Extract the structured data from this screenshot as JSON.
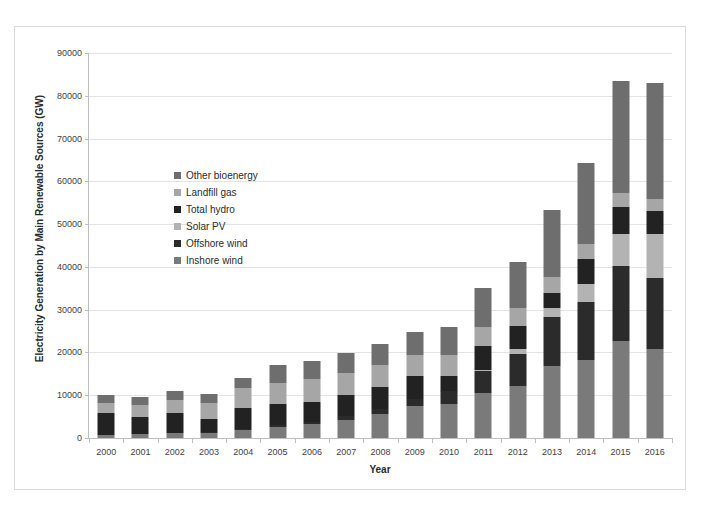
{
  "chart_data": {
    "type": "bar",
    "stacked": true,
    "title": "",
    "xlabel": "Year",
    "ylabel": "Electricity Generation by Main Renewable Sources (GW)",
    "ylim": [
      0,
      90000
    ],
    "ytick_step": 10000,
    "yticks": [
      "0",
      "10000",
      "20000",
      "30000",
      "40000",
      "50000",
      "60000",
      "70000",
      "80000",
      "90000"
    ],
    "grid": true,
    "legend_position": "inside-upper-left",
    "categories": [
      "2000",
      "2001",
      "2002",
      "2003",
      "2004",
      "2005",
      "2006",
      "2007",
      "2008",
      "2009",
      "2010",
      "2011",
      "2012",
      "2013",
      "2014",
      "2015",
      "2016"
    ],
    "series": [
      {
        "name": "Inshore wind",
        "color": "#7a7a7a",
        "values": [
          800,
          900,
          1100,
          1200,
          1900,
          2600,
          3200,
          4300,
          5600,
          7500,
          8000,
          10500,
          12100,
          16800,
          18300,
          22700,
          20900
        ]
      },
      {
        "name": "Offshore wind",
        "color": "#2b2b2b",
        "values": [
          0,
          0,
          0,
          100,
          300,
          400,
          650,
          800,
          1300,
          1700,
          2900,
          5100,
          7500,
          11500,
          13600,
          17600,
          16400
        ]
      },
      {
        "name": "Solar PV",
        "color": "#b3b3b3",
        "values": [
          0,
          0,
          0,
          0,
          0,
          0,
          0,
          0,
          0,
          0,
          100,
          250,
          1300,
          2000,
          4100,
          7500,
          10300
        ]
      },
      {
        "name": "Total hydro",
        "color": "#222222",
        "values": [
          5100,
          4100,
          4800,
          3100,
          4800,
          4900,
          4600,
          5000,
          5100,
          5300,
          3600,
          5700,
          5300,
          3500,
          5900,
          6300,
          5400
        ]
      },
      {
        "name": "Landfill gas",
        "color": "#a6a6a6",
        "values": [
          2400,
          2700,
          3100,
          3800,
          4600,
          5000,
          5300,
          5200,
          5100,
          4900,
          4700,
          4400,
          4100,
          3800,
          3500,
          3200,
          3000
        ]
      },
      {
        "name": "Other bioenergy",
        "color": "#6e6e6e",
        "values": [
          1700,
          1800,
          2000,
          2200,
          2400,
          4100,
          4250,
          4500,
          4800,
          5400,
          6700,
          9200,
          10800,
          15600,
          19000,
          26200,
          27000
        ]
      }
    ],
    "totals": [
      10000,
      9500,
      11000,
      10400,
      14000,
      17000,
      18000,
      19800,
      21900,
      24800,
      26000,
      35150,
      41100,
      53200,
      64400,
      83500,
      83000
    ]
  },
  "legend": {
    "items": [
      {
        "label": "Other bioenergy",
        "color": "#6e6e6e"
      },
      {
        "label": "Landfill gas",
        "color": "#a6a6a6"
      },
      {
        "label": "Total hydro",
        "color": "#222222"
      },
      {
        "label": "Solar PV",
        "color": "#b3b3b3"
      },
      {
        "label": "Offshore wind",
        "color": "#2b2b2b"
      },
      {
        "label": "Inshore wind",
        "color": "#7a7a7a"
      }
    ]
  }
}
